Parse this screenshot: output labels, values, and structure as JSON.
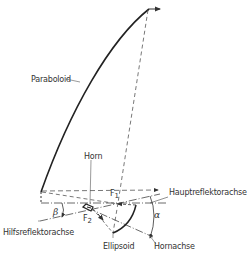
{
  "diagram": {
    "type": "offset-gregorian-antenna-geometry",
    "labels": {
      "paraboloid": "Paraboloid",
      "horn": "Horn",
      "main_axis": "Hauptreflektorachse",
      "sub_axis": "Hilfsreflektorachse",
      "ellipsoid": "Ellipsoid",
      "horn_axis": "Hornachse",
      "f1": "F",
      "f1_sub": "1",
      "f2": "F",
      "f2_sub": "2",
      "alpha": "α",
      "beta": "β"
    },
    "colors": {
      "line": "#333333",
      "background": "#ffffff"
    }
  }
}
